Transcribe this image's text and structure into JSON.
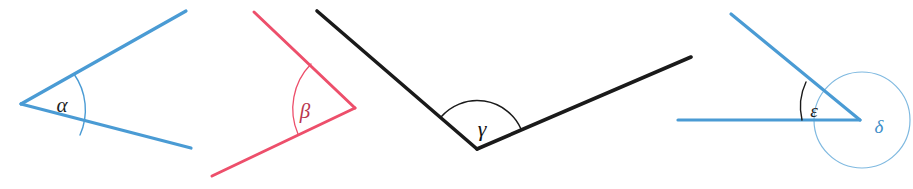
{
  "figure": {
    "width": 913,
    "height": 189,
    "background": "#ffffff"
  },
  "colors": {
    "blue": "#4a9bd4",
    "blue_light": "#7fb9e0",
    "red": "#ed4f6b",
    "black": "#1a1a1a",
    "label_blue": "#3f8fc9",
    "label_red": "#c94a60",
    "label_black": "#111111"
  },
  "angles": [
    {
      "id": "alpha",
      "label": "α",
      "label_x": 62,
      "label_y": 108,
      "label_size": 21,
      "label_color": "#1f1f1f",
      "stroke_color": "#4a9bd4",
      "stroke_width": 3.2,
      "vertex": {
        "x": 21,
        "y": 104
      },
      "ray1_end": {
        "x": 186,
        "y": 11
      },
      "ray2_end": {
        "x": 191,
        "y": 148
      },
      "arc": {
        "radius": 62,
        "start_x": 74,
        "start_y": 71,
        "end_x": 80,
        "end_y": 133,
        "sweep": 1,
        "stroke": "#4a9bd4",
        "stroke_width": 1.4
      }
    },
    {
      "id": "beta",
      "label": "β",
      "label_x": 305,
      "label_y": 112,
      "label_size": 21,
      "label_color": "#b9374f",
      "stroke_color": "#ed4f6b",
      "stroke_width": 3.0,
      "vertex": {
        "x": 355,
        "y": 108
      },
      "ray1_end": {
        "x": 254,
        "y": 12
      },
      "ray2_end": {
        "x": 212,
        "y": 176
      },
      "arc": {
        "radius": 64,
        "start_x": 311,
        "start_y": 64,
        "end_x": 298,
        "end_y": 133,
        "sweep": 0,
        "stroke": "#ed4f6b",
        "stroke_width": 1.3
      }
    },
    {
      "id": "gamma",
      "label": "γ",
      "label_x": 482,
      "label_y": 128,
      "label_size": 22,
      "label_color": "#111111",
      "stroke_color": "#1a1a1a",
      "stroke_width": 3.6,
      "vertex": {
        "x": 477,
        "y": 149
      },
      "ray1_end": {
        "x": 317,
        "y": 11
      },
      "ray2_end": {
        "x": 691,
        "y": 57
      },
      "arc": {
        "radius": 48,
        "start_x": 440,
        "start_y": 117,
        "end_x": 522,
        "end_y": 129,
        "sweep": 1,
        "stroke": "#1a1a1a",
        "stroke_width": 1.4
      }
    },
    {
      "id": "epsilon",
      "label": "ε",
      "label_x": 814,
      "label_y": 110,
      "label_size": 19,
      "label_color": "#1f1f1f",
      "stroke_color": "#4a9bd4",
      "stroke_width": 3.2,
      "vertex": {
        "x": 860,
        "y": 120
      },
      "ray1_end": {
        "x": 731,
        "y": 14
      },
      "ray2_end": {
        "x": 678,
        "y": 120
      },
      "arc": {
        "radius": 58,
        "start_x": 805,
        "start_y": 82,
        "end_x": 802,
        "end_y": 120,
        "sweep": 0,
        "stroke": "#1a1a1a",
        "stroke_width": 1.4
      }
    },
    {
      "id": "delta",
      "label": "δ",
      "label_x": 876,
      "label_y": 128,
      "label_size": 19,
      "label_color": "#3f8fc9",
      "stroke_color": "#7fb9e0",
      "stroke_width": 1.2,
      "circle": {
        "cx": 862,
        "cy": 120,
        "r": 48
      }
    }
  ]
}
